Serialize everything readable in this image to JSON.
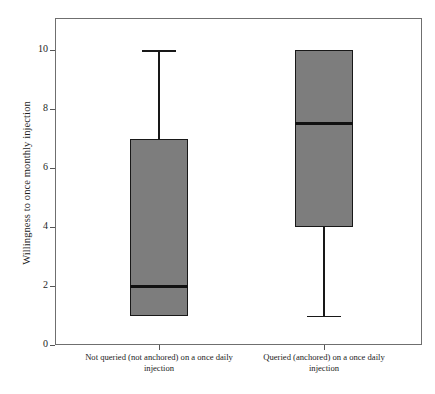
{
  "chart_data": {
    "type": "box",
    "title": "",
    "xlabel": "",
    "ylabel": "Willingness to once monthly injection",
    "ylim": [
      0,
      11.1
    ],
    "yticks": [
      0,
      2,
      4,
      6,
      8,
      10
    ],
    "ytick_labels": [
      "0",
      "2",
      "4",
      "6",
      "8",
      "10"
    ],
    "grid": false,
    "legend": "none",
    "categories": [
      "Not queried (not anchored) on a once daily injection",
      "Queried (anchored) on a once daily injection"
    ],
    "boxes": [
      {
        "name": "Not queried (not anchored) on a once daily injection",
        "label_line1": "Not queried (not anchored) on a once daily",
        "label_line2": "injection",
        "whisker_low": 1,
        "q1": 1,
        "median": 2,
        "q3": 7,
        "whisker_high": 10,
        "has_lower_cap": false,
        "has_upper_cap": true
      },
      {
        "name": "Queried (anchored) on a once daily injection",
        "label_line1": "Queried (anchored) on a once daily",
        "label_line2": "injection",
        "whisker_low": 1,
        "q1": 4,
        "median": 7.5,
        "q3": 10,
        "whisker_high": 10,
        "has_lower_cap": true,
        "has_upper_cap": false
      }
    ],
    "colors": {
      "box_fill": "#7d7d7d",
      "box_edge": "#181818",
      "median": "#111111",
      "whisker": "#181818",
      "frame": "#6f6f6f",
      "background": "#ffffff",
      "text": "#1d1d1d"
    }
  }
}
